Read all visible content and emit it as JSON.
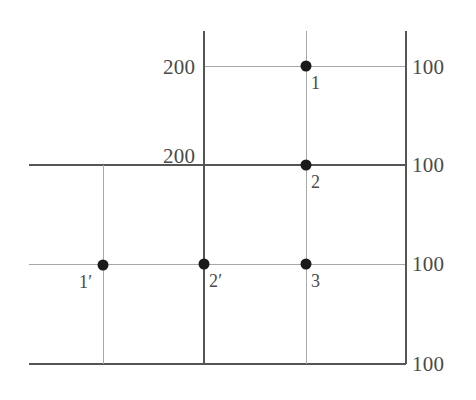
{
  "diagram": {
    "canvas": {
      "width": 476,
      "height": 400,
      "background": "#ffffff"
    },
    "colors": {
      "line_light": "#a8a8a8",
      "line_dark": "#555555",
      "node_fill": "#1a1a1a",
      "text": "#4a4a4a"
    },
    "value_labels": [
      {
        "id": "v-top-left",
        "text": "200",
        "x": 163,
        "y": 57,
        "align": "left"
      },
      {
        "id": "v-top-right",
        "text": "100",
        "x": 412,
        "y": 57,
        "align": "left"
      },
      {
        "id": "v-middle-left",
        "text": "200",
        "x": 163,
        "y": 146,
        "align": "left"
      },
      {
        "id": "v-middle-right",
        "text": "100",
        "x": 412,
        "y": 155,
        "align": "left"
      },
      {
        "id": "v-lower-right",
        "text": "100",
        "x": 412,
        "y": 254,
        "align": "left"
      },
      {
        "id": "v-bottom-right",
        "text": "100",
        "x": 412,
        "y": 354,
        "align": "left"
      }
    ],
    "nodes": [
      {
        "id": "node-1",
        "label": "1",
        "x": 306,
        "y": 66,
        "label_x": 311,
        "label_y": 74
      },
      {
        "id": "node-2",
        "label": "2",
        "x": 306,
        "y": 165,
        "label_x": 311,
        "label_y": 173
      },
      {
        "id": "node-3",
        "label": "3",
        "x": 306,
        "y": 264,
        "label_x": 311,
        "label_y": 272
      },
      {
        "id": "node-1p",
        "label": "1′",
        "x": 103,
        "y": 265,
        "label_x": 79,
        "label_y": 273
      },
      {
        "id": "node-2p",
        "label": "2′",
        "x": 204,
        "y": 264,
        "label_x": 209,
        "label_y": 272
      }
    ],
    "horizontal_lines": [
      {
        "id": "h-row-1",
        "x1": 203,
        "x2": 406,
        "y": 66,
        "weight": "light"
      },
      {
        "id": "h-row-2",
        "x1": 29,
        "x2": 406,
        "y": 165,
        "weight": "dark"
      },
      {
        "id": "h-row-3",
        "x1": 29,
        "x2": 406,
        "y": 264,
        "weight": "light"
      },
      {
        "id": "h-row-4",
        "x1": 29,
        "x2": 406,
        "y": 364,
        "weight": "dark"
      }
    ],
    "vertical_lines": [
      {
        "id": "v-col-left",
        "x": 103,
        "y1": 165,
        "y2": 364,
        "weight": "light"
      },
      {
        "id": "v-col-mid",
        "x": 204,
        "y1": 31,
        "y2": 364,
        "weight": "dark"
      },
      {
        "id": "v-col-node",
        "x": 306,
        "y1": 31,
        "y2": 364,
        "weight": "light"
      },
      {
        "id": "v-col-right",
        "x": 406,
        "y1": 31,
        "y2": 364,
        "weight": "dark"
      }
    ],
    "node_radius": 5.5
  }
}
